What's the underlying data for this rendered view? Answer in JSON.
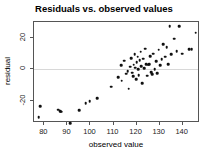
{
  "chart_data": {
    "type": "scatter",
    "title": "Residuals vs. observed values",
    "xlabel": "observed value",
    "ylabel": "residual",
    "xlim": [
      75.5,
      147.5
    ],
    "ylim": [
      -34,
      30
    ],
    "xticks": [
      80,
      90,
      100,
      110,
      120,
      130,
      140
    ],
    "xtick_labels": [
      "80",
      "90",
      "100",
      "110",
      "120",
      "130",
      "140"
    ],
    "yticks": [
      -20,
      0,
      20
    ],
    "ytick_labels": [
      "-20",
      "0",
      "20"
    ],
    "grid": false,
    "legend": null,
    "reference_lines": [
      {
        "orientation": "horizontal",
        "value": 0,
        "color": "#d8d8d8"
      }
    ],
    "marker": {
      "shape": "circle",
      "color": "#111111",
      "size": 2.6
    },
    "points": [
      {
        "x": 77.6,
        "y": -30.3
      },
      {
        "x": 78.3,
        "y": -23.2
      },
      {
        "x": 85.9,
        "y": -25.5
      },
      {
        "x": 86.8,
        "y": -26.7
      },
      {
        "x": 87.4,
        "y": -26.9
      },
      {
        "x": 91.2,
        "y": -34.0
      },
      {
        "x": 95.0,
        "y": -25.9
      },
      {
        "x": 97.9,
        "y": -21.6
      },
      {
        "x": 99.6,
        "y": -20.3
      },
      {
        "x": 102.8,
        "y": -18.4
      },
      {
        "x": 108.9,
        "y": -11.0
      },
      {
        "x": 112.0,
        "y": -5.1
      },
      {
        "x": 113.2,
        "y": 2.7
      },
      {
        "x": 113.6,
        "y": -7.3
      },
      {
        "x": 114.5,
        "y": 5.4
      },
      {
        "x": 115.4,
        "y": -2.7
      },
      {
        "x": 116.1,
        "y": -1.2
      },
      {
        "x": 116.6,
        "y": -12.3
      },
      {
        "x": 117.2,
        "y": 1.6
      },
      {
        "x": 117.6,
        "y": 7.1
      },
      {
        "x": 118.0,
        "y": -2.0
      },
      {
        "x": 118.4,
        "y": -4.5
      },
      {
        "x": 118.8,
        "y": 3.0
      },
      {
        "x": 119.2,
        "y": 9.6
      },
      {
        "x": 119.5,
        "y": 1.1
      },
      {
        "x": 119.8,
        "y": -6.4
      },
      {
        "x": 120.1,
        "y": 4.5
      },
      {
        "x": 120.4,
        "y": 8.1
      },
      {
        "x": 120.7,
        "y": 0.2
      },
      {
        "x": 121.0,
        "y": -3.8
      },
      {
        "x": 121.4,
        "y": 5.9
      },
      {
        "x": 121.8,
        "y": 11.3
      },
      {
        "x": 122.1,
        "y": 2.1
      },
      {
        "x": 122.5,
        "y": -8.6
      },
      {
        "x": 122.9,
        "y": 6.7
      },
      {
        "x": 123.3,
        "y": 0.6
      },
      {
        "x": 123.8,
        "y": 13.2
      },
      {
        "x": 124.2,
        "y": 3.4
      },
      {
        "x": 124.6,
        "y": -4.0
      },
      {
        "x": 125.0,
        "y": 3.0
      },
      {
        "x": 125.4,
        "y": 3.1
      },
      {
        "x": 125.9,
        "y": 8.4
      },
      {
        "x": 126.3,
        "y": -1.9
      },
      {
        "x": 126.8,
        "y": -3.2
      },
      {
        "x": 127.3,
        "y": 10.0
      },
      {
        "x": 127.9,
        "y": 0.1
      },
      {
        "x": 128.4,
        "y": 5.2
      },
      {
        "x": 128.9,
        "y": -2.4
      },
      {
        "x": 129.6,
        "y": 12.4
      },
      {
        "x": 130.2,
        "y": 2.8
      },
      {
        "x": 130.9,
        "y": 6.3
      },
      {
        "x": 131.6,
        "y": 16.0
      },
      {
        "x": 132.3,
        "y": 8.0
      },
      {
        "x": 133.0,
        "y": 14.1
      },
      {
        "x": 133.6,
        "y": 3.3
      },
      {
        "x": 134.3,
        "y": 27.3
      },
      {
        "x": 135.0,
        "y": 9.5
      },
      {
        "x": 136.2,
        "y": 19.5
      },
      {
        "x": 137.4,
        "y": 11.6
      },
      {
        "x": 138.6,
        "y": 27.2
      },
      {
        "x": 139.9,
        "y": 9.8
      },
      {
        "x": 142.9,
        "y": 12.9
      },
      {
        "x": 143.9,
        "y": 12.8
      },
      {
        "x": 145.6,
        "y": 23.3
      }
    ]
  }
}
